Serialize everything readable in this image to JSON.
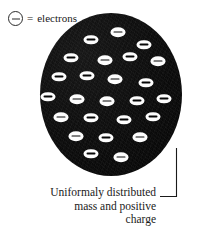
{
  "figure": {
    "background_color": "#ffffff",
    "sphere_color": "#0c0c0c",
    "electron_color": "#fdfdfd",
    "ink_color": "#1a1a1a"
  },
  "legend": {
    "symbol_name": "circled-minus-electron-symbol",
    "equals": "=",
    "label": "electrons"
  },
  "atom": {
    "name": "uniform-positive-charge-sphere",
    "electron_count": 25,
    "electrons": [
      {
        "id": 1,
        "x": 50.5,
        "y": 26.5
      },
      {
        "id": 2,
        "x": 77.5,
        "y": 19.0
      },
      {
        "id": 3,
        "x": 103.5,
        "y": 31.5
      },
      {
        "id": 4,
        "x": 30.5,
        "y": 44.5
      },
      {
        "id": 5,
        "x": 64.5,
        "y": 47.0
      },
      {
        "id": 6,
        "x": 89.5,
        "y": 43.5
      },
      {
        "id": 7,
        "x": 118.0,
        "y": 48.0
      },
      {
        "id": 8,
        "x": 18.5,
        "y": 63.5
      },
      {
        "id": 9,
        "x": 46.5,
        "y": 62.5
      },
      {
        "id": 10,
        "x": 75.0,
        "y": 66.0
      },
      {
        "id": 11,
        "x": 105.5,
        "y": 69.5
      },
      {
        "id": 12,
        "x": 8.0,
        "y": 83.5
      },
      {
        "id": 13,
        "x": 36.5,
        "y": 86.0
      },
      {
        "id": 14,
        "x": 67.0,
        "y": 88.0
      },
      {
        "id": 15,
        "x": 96.5,
        "y": 87.5
      },
      {
        "id": 16,
        "x": 124.0,
        "y": 85.5
      },
      {
        "id": 17,
        "x": 20.5,
        "y": 104.0
      },
      {
        "id": 18,
        "x": 51.0,
        "y": 104.5
      },
      {
        "id": 19,
        "x": 83.5,
        "y": 106.5
      },
      {
        "id": 20,
        "x": 113.0,
        "y": 103.5
      },
      {
        "id": 21,
        "x": 35.5,
        "y": 123.0
      },
      {
        "id": 22,
        "x": 65.5,
        "y": 124.5
      },
      {
        "id": 23,
        "x": 99.5,
        "y": 124.0
      },
      {
        "id": 24,
        "x": 51.0,
        "y": 140.5
      },
      {
        "id": 25,
        "x": 81.0,
        "y": 144.0
      }
    ]
  },
  "annotation": {
    "leader_name": "caption-leader-line",
    "lines": [
      "Uniformaly distributed",
      "mass and positive",
      "charge"
    ]
  },
  "page_bleed": {
    "text": ""
  }
}
